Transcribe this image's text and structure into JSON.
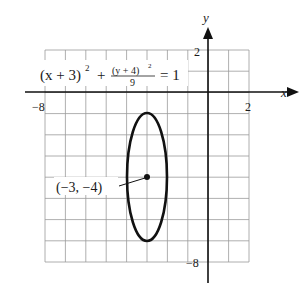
{
  "chart_data": {
    "type": "line",
    "title": "",
    "equation": {
      "lhs_a": "(x + 3)",
      "lhs_a_exp": "2",
      "plus": "+",
      "frac_num": "(y + 4)",
      "frac_num_exp": "2",
      "frac_den": "9",
      "rhs": "= 1"
    },
    "xlabel": "x",
    "ylabel": "y",
    "xlim": [
      -8,
      2
    ],
    "ylim": [
      -8,
      2
    ],
    "grid": true,
    "x_tick_labels": [
      "−8",
      "2"
    ],
    "y_tick_labels": [
      "2",
      "−8"
    ],
    "series": [
      {
        "name": "ellipse",
        "shape": "ellipse",
        "center": [
          -3,
          -4
        ],
        "semi_axis_x": 1,
        "semi_axis_y": 3
      }
    ],
    "annotations": [
      {
        "text": "(−3, −4)",
        "point": [
          -3,
          -4
        ]
      }
    ]
  }
}
